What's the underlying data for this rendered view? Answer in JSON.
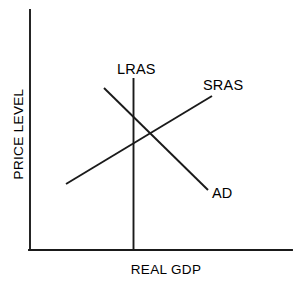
{
  "chart_data": {
    "type": "line",
    "title": "",
    "subtitle": "",
    "xlabel": "REAL GDP",
    "ylabel": "PRICE LEVEL",
    "xlim": [
      0,
      100
    ],
    "ylim": [
      0,
      100
    ],
    "grid": false,
    "legend_position": "inline-endpoint-labels",
    "background_color": "#ffffff",
    "line_color": "#1a1a1a",
    "axis_color": "#1a1a1a",
    "axis": {
      "y_axis": {
        "x": 30,
        "y_top": 10,
        "y_bottom": 250
      },
      "x_axis": {
        "y": 250,
        "x_left": 30,
        "x_right": 292
      },
      "tick_labels_x": [],
      "tick_labels_y": []
    },
    "series": [
      {
        "name": "LRAS",
        "description": "Long Run Aggregate Supply — vertical line",
        "orientation": "vertical",
        "points": [
          [
            133.5,
            78
          ],
          [
            133.5,
            250
          ]
        ],
        "label": "LRAS",
        "label_x": 117,
        "label_y": 74
      },
      {
        "name": "SRAS",
        "description": "Short Run Aggregate Supply — upward sloping",
        "orientation": "upward",
        "points": [
          [
            66,
            184
          ],
          [
            212,
            96
          ]
        ],
        "label": "SRAS",
        "label_x": 203,
        "label_y": 90
      },
      {
        "name": "AD",
        "description": "Aggregate Demand — downward sloping",
        "orientation": "downward",
        "points": [
          [
            104,
            88
          ],
          [
            208,
            190
          ]
        ],
        "label": "AD",
        "label_x": 212,
        "label_y": 198
      }
    ],
    "equilibrium": {
      "x": 145,
      "y": 130,
      "label": ""
    },
    "annotations": []
  },
  "labels": {
    "lras": "LRAS",
    "sras": "SRAS",
    "ad": "AD",
    "x_axis": "REAL GDP",
    "y_axis": "PRICE LEVEL"
  }
}
